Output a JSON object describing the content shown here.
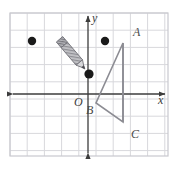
{
  "figure": {
    "width": 178,
    "height": 170,
    "background": "#ffffff"
  },
  "grid": {
    "cell_size": 17.2,
    "line_color": "#d8d8dc",
    "border_color": "#c9c9cf",
    "bounds": {
      "left": 10,
      "top": 13,
      "right": 168,
      "bottom": 156
    },
    "columns": 9,
    "rows": 8
  },
  "axes": {
    "color": "#3c3c3c",
    "x_axis": {
      "label": "x",
      "label_x": 158,
      "label_y": 104,
      "y": 94,
      "from_x": 12,
      "to_x": 166,
      "arrow_start": true,
      "arrow_end": true
    },
    "y_axis": {
      "label": "y",
      "label_x": 92,
      "label_y": 22,
      "x": 88,
      "from_y": 15,
      "to_y": 154,
      "arrow_start": true,
      "arrow_end": true
    },
    "origin": {
      "label": "O",
      "x": 88,
      "y": 94,
      "label_x": 74,
      "label_y": 106
    }
  },
  "triangle": {
    "name": "triangle-abc",
    "stroke": "#8c8c93",
    "stroke_width": 1.6,
    "fill": "none",
    "vertices": [
      {
        "label": "A",
        "x": 123,
        "y": 43,
        "label_x": 133,
        "label_y": 36
      },
      {
        "label": "B",
        "x": 96,
        "y": 103,
        "label_x": 86,
        "label_y": 114
      },
      {
        "label": "C",
        "x": 123,
        "y": 122,
        "label_x": 131,
        "label_y": 138
      }
    ]
  },
  "points": [
    {
      "name": "point-left",
      "x": 32,
      "y": 41,
      "r": 4.2,
      "color": "#1a1a1a"
    },
    {
      "name": "point-upper-right",
      "x": 105,
      "y": 41,
      "r": 4.2,
      "color": "#1a1a1a"
    },
    {
      "name": "point-pencil-tip",
      "x": 89,
      "y": 74,
      "r": 4.6,
      "color": "#1a1a1a"
    }
  ],
  "pencil": {
    "name": "pencil-icon",
    "tip_x": 88,
    "tip_y": 73,
    "tail_x": 57,
    "tail_y": 36,
    "body_color": "#b9b9bd",
    "stripe_color": "#8e8e94",
    "outline_color": "#6d6d73",
    "eraser_color": "#9a9aa0"
  }
}
